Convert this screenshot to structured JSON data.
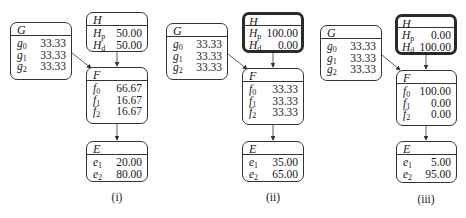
{
  "figure": {
    "panels": [
      {
        "caption": "(i)",
        "nodes": {
          "G": {
            "title": "G",
            "rows": [
              {
                "state": "g",
                "sub": "0",
                "value": "33.33"
              },
              {
                "state": "g",
                "sub": "1",
                "value": "33.33"
              },
              {
                "state": "g",
                "sub": "2",
                "value": "33.33"
              }
            ]
          },
          "H": {
            "title": "H",
            "evidence": false,
            "rows": [
              {
                "state": "H",
                "sub": "p",
                "value": "50.00"
              },
              {
                "state": "H",
                "sub": "d",
                "value": "50.00"
              }
            ]
          },
          "F": {
            "title": "F",
            "rows": [
              {
                "state": "f",
                "sub": "0",
                "value": "66.67"
              },
              {
                "state": "f",
                "sub": "1",
                "value": "16.67"
              },
              {
                "state": "f",
                "sub": "2",
                "value": "16.67"
              }
            ]
          },
          "E": {
            "title": "E",
            "rows": [
              {
                "state": "e",
                "sub": "1",
                "value": "20.00"
              },
              {
                "state": "e",
                "sub": "2",
                "value": "80.00"
              }
            ]
          }
        }
      },
      {
        "caption": "(ii)",
        "nodes": {
          "G": {
            "title": "G",
            "rows": [
              {
                "state": "g",
                "sub": "0",
                "value": "33.33"
              },
              {
                "state": "g",
                "sub": "1",
                "value": "33.33"
              },
              {
                "state": "g",
                "sub": "2",
                "value": "33.33"
              }
            ]
          },
          "H": {
            "title": "H",
            "evidence": true,
            "rows": [
              {
                "state": "H",
                "sub": "p",
                "value": "100.00"
              },
              {
                "state": "H",
                "sub": "d",
                "value": "0.00"
              }
            ]
          },
          "F": {
            "title": "F",
            "rows": [
              {
                "state": "f",
                "sub": "0",
                "value": "33.33"
              },
              {
                "state": "f",
                "sub": "1",
                "value": "33.33"
              },
              {
                "state": "f",
                "sub": "2",
                "value": "33.33"
              }
            ]
          },
          "E": {
            "title": "E",
            "rows": [
              {
                "state": "e",
                "sub": "1",
                "value": "35.00"
              },
              {
                "state": "e",
                "sub": "2",
                "value": "65.00"
              }
            ]
          }
        }
      },
      {
        "caption": "(iii)",
        "nodes": {
          "G": {
            "title": "G",
            "rows": [
              {
                "state": "g",
                "sub": "0",
                "value": "33.33"
              },
              {
                "state": "g",
                "sub": "1",
                "value": "33.33"
              },
              {
                "state": "g",
                "sub": "2",
                "value": "33.33"
              }
            ]
          },
          "H": {
            "title": "H",
            "evidence": true,
            "rows": [
              {
                "state": "H",
                "sub": "p",
                "value": "0.00"
              },
              {
                "state": "H",
                "sub": "d",
                "value": "100.00"
              }
            ]
          },
          "F": {
            "title": "F",
            "rows": [
              {
                "state": "f",
                "sub": "0",
                "value": "100.00"
              },
              {
                "state": "f",
                "sub": "1",
                "value": "0.00"
              },
              {
                "state": "f",
                "sub": "2",
                "value": "0.00"
              }
            ]
          },
          "E": {
            "title": "E",
            "rows": [
              {
                "state": "e",
                "sub": "1",
                "value": "5.00"
              },
              {
                "state": "e",
                "sub": "2",
                "value": "95.00"
              }
            ]
          }
        }
      }
    ],
    "edges": [
      [
        "G",
        "F"
      ],
      [
        "H",
        "F"
      ],
      [
        "F",
        "E"
      ]
    ],
    "colors": {
      "border": "#333333",
      "evidence_border": "#2a2a2a",
      "text": "#1a1a1a"
    }
  }
}
